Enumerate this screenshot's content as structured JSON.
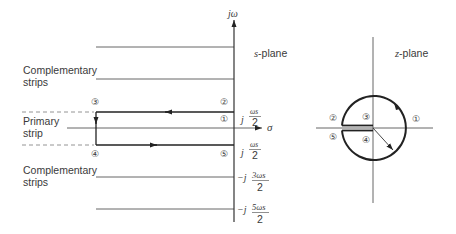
{
  "s_plane": {
    "title_var": "s",
    "title_rest": "-plane",
    "axis_vertical_label_j": "j",
    "axis_vertical_label_omega": "ω",
    "axis_horizontal_label": "σ",
    "strip_labels": {
      "complementary_top_line1": "Complementary",
      "complementary_top_line2": "strips",
      "primary_line1": "Primary",
      "primary_line2": "strip",
      "complementary_bottom_line1": "Complementary",
      "complementary_bottom_line2": "strips"
    },
    "frequency_labels": [
      {
        "prefix": "j",
        "numerator": "ωs",
        "denominator": "2"
      },
      {
        "prefix": "j",
        "numerator": "ωs",
        "denominator": "2"
      },
      {
        "prefix": "−j",
        "numerator": "3ωs",
        "denominator": "2"
      },
      {
        "prefix": "−j",
        "numerator": "5ωs",
        "denominator": "2"
      }
    ],
    "contour_points": [
      "①",
      "②",
      "③",
      "④",
      "⑤"
    ]
  },
  "z_plane": {
    "title_var": "z",
    "title_rest": "-plane",
    "contour_points": [
      "①",
      "②",
      "③",
      "④",
      "⑤"
    ]
  }
}
